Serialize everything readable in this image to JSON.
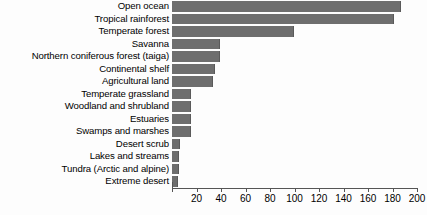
{
  "chart_data": {
    "type": "bar",
    "orientation": "horizontal",
    "title": "",
    "xlabel": "",
    "ylabel": "",
    "xlim": [
      0,
      200
    ],
    "xticks": [
      0,
      20,
      40,
      60,
      80,
      100,
      120,
      140,
      160,
      180,
      200
    ],
    "xticklabels": [
      "",
      "20",
      "40",
      "60",
      "80",
      "100",
      "120",
      "140",
      "160",
      "180",
      "200"
    ],
    "grid": false,
    "legend": false,
    "bar_color": "#6e6e6e",
    "categories": [
      "Open ocean",
      "Tropical rainforest",
      "Temperate forest",
      "Savanna",
      "Northern coniferous forest (taiga)",
      "Continental shelf",
      "Agricultural land",
      "Temperate grassland",
      "Woodland and shrubland",
      "Estuaries",
      "Swamps and marshes",
      "Desert scrub",
      "Lakes and streams",
      "Tundra (Arctic and alpine)",
      "Extreme desert"
    ],
    "values": [
      186,
      180,
      99,
      38,
      38,
      34,
      33,
      15,
      15,
      15,
      15,
      6,
      5,
      5,
      4
    ]
  }
}
